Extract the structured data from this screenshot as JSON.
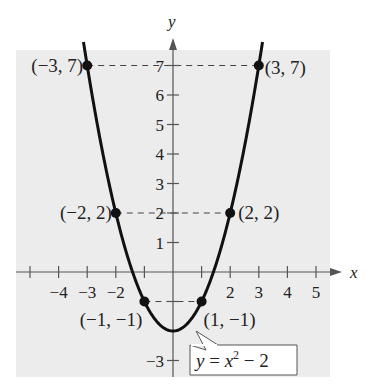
{
  "chart_data": {
    "type": "line",
    "title": "",
    "xlabel": "x",
    "ylabel": "y",
    "xlim": [
      -5,
      5
    ],
    "ylim": [
      -3,
      7
    ],
    "x_ticks": [
      -5,
      -4,
      -3,
      -2,
      -1,
      1,
      2,
      3,
      4,
      5
    ],
    "x_tick_labels": [
      "-4",
      "-3",
      "-2",
      "2",
      "3",
      "4",
      "5"
    ],
    "y_ticks": [
      -3,
      -2,
      -1,
      1,
      2,
      3,
      4,
      5,
      6,
      7
    ],
    "y_tick_labels": [
      "-3",
      "1",
      "2",
      "3",
      "4",
      "5",
      "6",
      "7"
    ],
    "grid": false,
    "series": [
      {
        "name": "y = x^2 - 2",
        "function": "x^2 - 2",
        "x": [
          -3.1,
          -3,
          -2,
          -1,
          0,
          1,
          2,
          3,
          3.1
        ],
        "values": [
          7.61,
          7,
          2,
          -1,
          -2,
          -1,
          2,
          7,
          7.61
        ]
      }
    ],
    "points": [
      {
        "x": -3,
        "y": 7,
        "label": "(−3, 7)"
      },
      {
        "x": 3,
        "y": 7,
        "label": "(3, 7)"
      },
      {
        "x": -2,
        "y": 2,
        "label": "(−2, 2)"
      },
      {
        "x": 2,
        "y": 2,
        "label": "(2, 2)"
      },
      {
        "x": -1,
        "y": -1,
        "label": "(−1, −1)"
      },
      {
        "x": 1,
        "y": -1,
        "label": "(1, −1)"
      }
    ],
    "annotations": [
      {
        "text": "y = x² − 2",
        "type": "callout-box",
        "points_to": "curve near (1.3, -0.3)"
      }
    ],
    "guide_lines": "dashed horizontal lines from labeled points to y-axis at y=7, y=2, y=-1"
  },
  "labels": {
    "axis_x": "x",
    "axis_y": "y",
    "equation_y": "y",
    "equation_eq": " = ",
    "equation_x": "x",
    "equation_exp": "2",
    "equation_rest": " − 2"
  },
  "colors": {
    "plot_bg": "#ececec",
    "curve": "#111111",
    "axis": "#555555",
    "text": "#222222"
  }
}
